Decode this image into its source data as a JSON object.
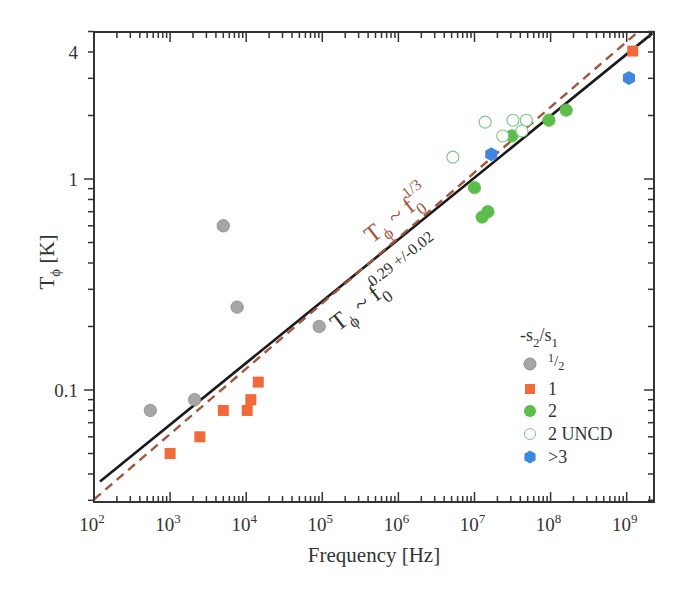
{
  "chart_data": {
    "type": "scatter",
    "title": "",
    "xlabel": "Frequency [Hz]",
    "ylabel": "T_ϕ [K]",
    "xscale": "log",
    "yscale": "log",
    "xlim": [
      100,
      2200000000
    ],
    "ylim": [
      0.0295,
      5.0
    ],
    "grid": false,
    "x_ticks": [
      {
        "value": 100,
        "label": "10",
        "exp": "2"
      },
      {
        "value": 1000,
        "label": "10",
        "exp": "3"
      },
      {
        "value": 10000,
        "label": "10",
        "exp": "4"
      },
      {
        "value": 100000,
        "label": "10",
        "exp": "5"
      },
      {
        "value": 1000000,
        "label": "10",
        "exp": "6"
      },
      {
        "value": 10000000,
        "label": "10",
        "exp": "7"
      },
      {
        "value": 100000000,
        "label": "10",
        "exp": "8"
      },
      {
        "value": 1000000000,
        "label": "10",
        "exp": "9"
      }
    ],
    "y_ticks": [
      {
        "value": 0.1,
        "label": "0.1"
      },
      {
        "value": 1,
        "label": "1"
      },
      {
        "value": 4,
        "label": "4"
      }
    ],
    "legend": {
      "title": "-s2/s1",
      "position": "lower right",
      "entries": [
        "1/2",
        "1",
        "2",
        "2 UNCD",
        ">3"
      ]
    },
    "series": [
      {
        "name": "1/2",
        "marker": "circle",
        "filled": true,
        "color": "#a6a6a6",
        "edge": "#8a8a8a",
        "points": [
          [
            550,
            0.08
          ],
          [
            2100,
            0.09
          ],
          [
            5000,
            0.6
          ],
          [
            7600,
            0.247
          ],
          [
            91000,
            0.2
          ]
        ]
      },
      {
        "name": "1",
        "marker": "square",
        "filled": true,
        "color": "#f26a3a",
        "edge": "#f26a3a",
        "points": [
          [
            1000,
            0.05
          ],
          [
            2460,
            0.06
          ],
          [
            5000,
            0.08
          ],
          [
            10300,
            0.08
          ],
          [
            11500,
            0.09
          ],
          [
            14400,
            0.109
          ],
          [
            1200000000,
            4.04
          ]
        ]
      },
      {
        "name": "2",
        "marker": "circle",
        "filled": true,
        "color": "#5cbd4a",
        "edge": "#5cbd4a",
        "points": [
          [
            10000000,
            0.91
          ],
          [
            12600000,
            0.66
          ],
          [
            15000000,
            0.7
          ],
          [
            31000000,
            1.6
          ],
          [
            95000000,
            1.9
          ],
          [
            160000000,
            2.12
          ]
        ]
      },
      {
        "name": "2 UNCD",
        "marker": "circle",
        "filled": false,
        "color": "#ffffff",
        "edge": "#7fc68a",
        "points": [
          [
            5200000,
            1.27
          ],
          [
            13800000,
            1.86
          ],
          [
            23500000,
            1.6
          ],
          [
            32000000,
            1.9
          ],
          [
            42000000,
            1.69
          ],
          [
            48000000,
            1.9
          ]
        ]
      },
      {
        "name": ">3",
        "marker": "hexagon",
        "filled": true,
        "color": "#3f86e0",
        "edge": "#3f86e0",
        "points": [
          [
            16600000,
            1.31
          ],
          [
            1070000000,
            3.01
          ]
        ]
      }
    ],
    "fit_lines": [
      {
        "name": "fit",
        "style": "solid",
        "color": "#1a1a1a",
        "width": 2.6,
        "from": [
          120,
          0.0368
        ],
        "to": [
          2170000000,
          4.9
        ],
        "label_base": "T",
        "label_sub": "ϕ",
        "label_mid": " ~ f",
        "label_sub2": "0",
        "label_sup": "0.29 +/-0.02",
        "label_color": "#333333"
      },
      {
        "name": "one-third",
        "style": "dashed",
        "color": "#a0573e",
        "width": 2.4,
        "from": [
          100,
          0.0303
        ],
        "to": [
          1430000000,
          5.0
        ],
        "label_base": "T",
        "label_sub": "ϕ",
        "label_mid": " ~ f",
        "label_sub2": "0",
        "label_sup": "1/3",
        "label_color": "#a0573e"
      }
    ]
  },
  "axes": {
    "x_title": "Frequency [Hz]",
    "y_title_main": "T",
    "y_title_sub": "ϕ",
    "y_title_unit": " [K]"
  },
  "legend": {
    "title_main": "-s",
    "title_sub1": "2",
    "title_slash": "/s",
    "title_sub2": "1",
    "items": [
      {
        "label": "1/2",
        "num": "1",
        "den": "2"
      },
      {
        "label": "1"
      },
      {
        "label": "2"
      },
      {
        "label": "2 UNCD"
      },
      {
        "label": ">3"
      }
    ]
  }
}
